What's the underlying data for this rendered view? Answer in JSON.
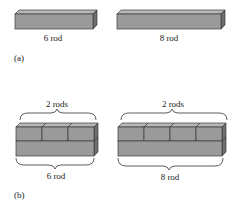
{
  "colors": {
    "front": "#9a9a9a",
    "top": "#b8b8b8",
    "side": "#6e6e6e",
    "edge": "#3a3a3a"
  },
  "part_a": {
    "label": "(a)",
    "rods": [
      {
        "label": "6 rod",
        "units": 6
      },
      {
        "label": "8 rod",
        "units": 8
      }
    ]
  },
  "part_b": {
    "label": "(b)",
    "groups": [
      {
        "top_label": "2 rods",
        "bottom_label": "6 rod",
        "top_count": 3,
        "units": 6
      },
      {
        "top_label": "2 rods",
        "bottom_label": "8 rod",
        "top_count": 4,
        "units": 8
      }
    ]
  }
}
